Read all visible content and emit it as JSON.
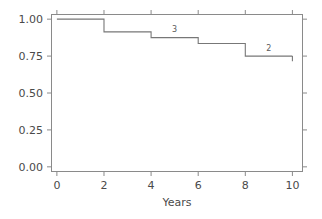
{
  "chart_data": {
    "type": "line",
    "subtype": "step-kaplan-meier",
    "title": "",
    "subtitle": "",
    "xlabel": "Years",
    "ylabel": "",
    "xlim": [
      -0.25,
      10.45
    ],
    "ylim": [
      -0.035,
      1.035
    ],
    "grid": false,
    "legend": null,
    "xticks": [
      0,
      2,
      4,
      6,
      8,
      10
    ],
    "xtick_labels": [
      "0",
      "2",
      "4",
      "6",
      "8",
      "10"
    ],
    "yticks": [
      0.0,
      0.25,
      0.5,
      0.75,
      1.0
    ],
    "ytick_labels": [
      "0.00",
      "0.25",
      "0.50",
      "0.75",
      "1.00"
    ],
    "series": [
      {
        "name": "survival",
        "step": "post",
        "color": "#777777",
        "x": [
          0,
          2,
          2,
          4,
          4,
          6,
          6,
          8,
          8,
          10
        ],
        "y": [
          1.0,
          1.0,
          0.914,
          0.914,
          0.875,
          0.875,
          0.835,
          0.835,
          0.75,
          0.75
        ]
      }
    ],
    "censor_ticks": [
      {
        "x": 10,
        "y_top": 0.75,
        "y_bottom": 0.715
      }
    ],
    "annotations": [
      {
        "text": "3",
        "x": 5.0,
        "y": 0.935,
        "label_for": "at-risk-count"
      },
      {
        "text": "2",
        "x": 9.0,
        "y": 0.808,
        "label_for": "at-risk-count"
      }
    ],
    "colors": {
      "line": "#777777",
      "axis": "#8a8a8a",
      "text": "#4a4a4a",
      "background": "#ffffff"
    }
  }
}
